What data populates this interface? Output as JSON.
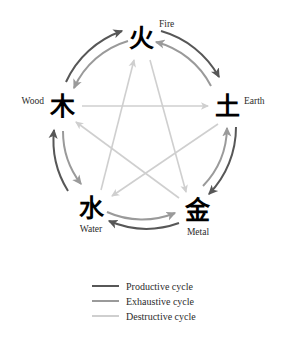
{
  "diagram": {
    "background_color": "#ffffff",
    "nodes": [
      {
        "id": "fire",
        "glyph": "火",
        "label": "Fire",
        "label_position": "upper-right",
        "cx": 141,
        "cy": 38,
        "glyph_x": 141,
        "glyph_y": 47,
        "label_x": 159,
        "label_y": 27
      },
      {
        "id": "earth",
        "glyph": "土",
        "label": "Earth",
        "label_position": "right",
        "cx": 227,
        "cy": 106,
        "glyph_x": 227,
        "glyph_y": 115,
        "label_x": 244,
        "label_y": 104
      },
      {
        "id": "metal",
        "glyph": "金",
        "label": "Metal",
        "label_position": "below",
        "cx": 197,
        "cy": 210,
        "glyph_x": 197,
        "glyph_y": 219,
        "label_x": 198,
        "label_y": 235
      },
      {
        "id": "water",
        "glyph": "水",
        "label": "Water",
        "label_position": "below",
        "cx": 91,
        "cy": 208,
        "glyph_x": 91,
        "glyph_y": 217,
        "label_x": 91,
        "label_y": 232
      },
      {
        "id": "wood",
        "glyph": "木",
        "label": "Wood",
        "label_position": "left",
        "cx": 62,
        "cy": 106,
        "glyph_x": 62,
        "glyph_y": 115,
        "label_x": 44,
        "label_y": 104
      }
    ],
    "cycles": [
      {
        "id": "productive",
        "name": "Productive cycle",
        "color": "#575757",
        "direction": "clockwise",
        "edges": [
          "wood→fire",
          "fire→earth",
          "earth→metal",
          "metal→water",
          "water→wood"
        ]
      },
      {
        "id": "exhaustive",
        "name": "Exhaustive cycle",
        "color": "#9a9a9a",
        "direction": "counter-clockwise",
        "edges": [
          "fire→wood",
          "earth→fire",
          "metal→earth",
          "water→metal",
          "wood→water"
        ]
      },
      {
        "id": "destructive",
        "name": "Destructive cycle",
        "color": "#cfcfcf",
        "direction": "pentagram",
        "edges": [
          "wood→earth",
          "earth→water",
          "water→fire",
          "fire→metal",
          "metal→wood"
        ]
      }
    ]
  },
  "legend": {
    "items": [
      {
        "id": "productive",
        "label": "Productive cycle",
        "color": "#575757",
        "swatch_y": 286
      },
      {
        "id": "exhaustive",
        "label": "Exhaustive cycle",
        "color": "#9a9a9a",
        "swatch_y": 301
      },
      {
        "id": "destructive",
        "label": "Destructive cycle",
        "color": "#cfcfcf",
        "swatch_y": 316
      }
    ],
    "swatch_x1": 92,
    "swatch_x2": 119,
    "text_x": 126
  }
}
